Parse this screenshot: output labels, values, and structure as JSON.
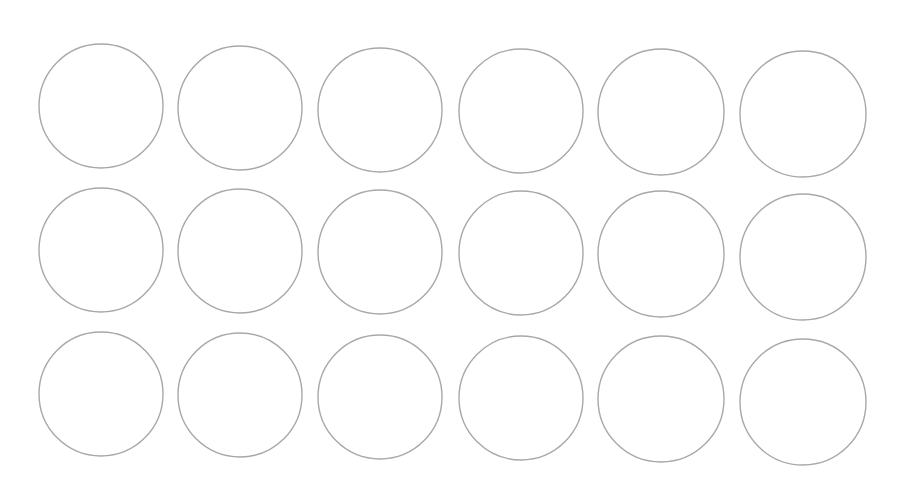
{
  "canvas": {
    "width": 899,
    "height": 486,
    "background": "#ffffff"
  },
  "style": {
    "stroke": "#a8a8a8",
    "stroke_width": 1.4,
    "fill": "none"
  },
  "circles": [
    {
      "cx": 101,
      "cy": 106,
      "r": 62
    },
    {
      "cx": 240,
      "cy": 108,
      "r": 62
    },
    {
      "cx": 380,
      "cy": 110,
      "r": 62
    },
    {
      "cx": 521,
      "cy": 111,
      "r": 62
    },
    {
      "cx": 661,
      "cy": 112,
      "r": 63
    },
    {
      "cx": 803,
      "cy": 114,
      "r": 63
    },
    {
      "cx": 101,
      "cy": 250,
      "r": 62
    },
    {
      "cx": 240,
      "cy": 251,
      "r": 62
    },
    {
      "cx": 380,
      "cy": 252,
      "r": 62
    },
    {
      "cx": 521,
      "cy": 253,
      "r": 62
    },
    {
      "cx": 661,
      "cy": 254,
      "r": 63
    },
    {
      "cx": 803,
      "cy": 257,
      "r": 63
    },
    {
      "cx": 101,
      "cy": 394,
      "r": 62
    },
    {
      "cx": 240,
      "cy": 395,
      "r": 62
    },
    {
      "cx": 380,
      "cy": 397,
      "r": 62
    },
    {
      "cx": 521,
      "cy": 398,
      "r": 62
    },
    {
      "cx": 661,
      "cy": 399,
      "r": 63
    },
    {
      "cx": 803,
      "cy": 402,
      "r": 63
    }
  ]
}
